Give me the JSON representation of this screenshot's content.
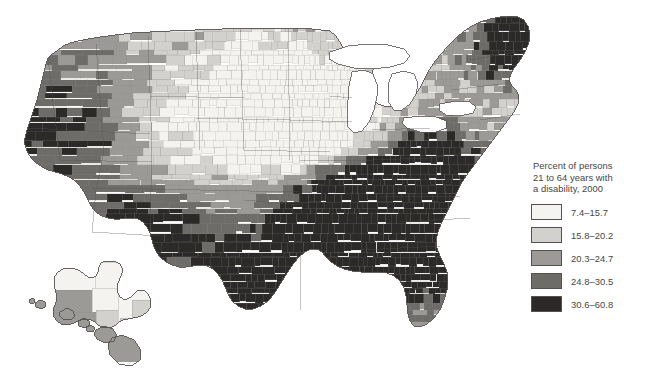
{
  "figure": {
    "kind": "choropleth-map",
    "region": "United States counties with Alaska and Hawaii insets",
    "background_color": "#ffffff",
    "water_color": "#ffffff",
    "border_color": "#55514e"
  },
  "legend": {
    "title": "Percent of persons\n21 to 64 years with\na disability, 2000",
    "title_lines": [
      "Percent of persons",
      "21 to 64 years with",
      "a disability, 2000"
    ],
    "classes": [
      {
        "label": "7.4–15.7",
        "color": "#f4f3f0",
        "min": 7.4,
        "max": 15.7
      },
      {
        "label": "15.8–20.2",
        "color": "#d2d1cd",
        "min": 15.8,
        "max": 20.2
      },
      {
        "label": "20.3–24.7",
        "color": "#9b9a96",
        "min": 20.3,
        "max": 24.7
      },
      {
        "label": "24.8–30.5",
        "color": "#6d6c69",
        "min": 24.8,
        "max": 30.5
      },
      {
        "label": "30.6–60.8",
        "color": "#2b2a28",
        "min": 30.6,
        "max": 60.8
      }
    ]
  },
  "chart_data": {
    "type": "heatmap",
    "title": "Percent of persons 21 to 64 years with a disability, 2000",
    "xlabel": "",
    "ylabel": "",
    "unit": "percent",
    "value_range": [
      7.4,
      60.8
    ],
    "classes": [
      "7.4–15.7",
      "15.8–20.2",
      "20.3–24.7",
      "24.8–30.5",
      "30.6–60.8"
    ],
    "class_colors": [
      "#f4f3f0",
      "#d2d1cd",
      "#9b9a96",
      "#6d6c69",
      "#2b2a28"
    ],
    "legend_position": "right",
    "grid": false,
    "regions": [
      {
        "name": "Maine",
        "class": 5,
        "note": "northern Maine darkest"
      },
      {
        "name": "Northern New England",
        "class": 4
      },
      {
        "name": "Southern New England",
        "class": 2
      },
      {
        "name": "New York metro",
        "class": 2
      },
      {
        "name": "Upstate New York",
        "class": 3
      },
      {
        "name": "Pennsylvania",
        "class": 3
      },
      {
        "name": "Appalachia / West Virginia",
        "class": 5
      },
      {
        "name": "Eastern Kentucky",
        "class": 5
      },
      {
        "name": "Tennessee",
        "class": 4
      },
      {
        "name": "Mississippi Delta",
        "class": 5
      },
      {
        "name": "Alabama",
        "class": 5
      },
      {
        "name": "Georgia",
        "class": 4
      },
      {
        "name": "Florida peninsula",
        "class": 3
      },
      {
        "name": "Carolinas",
        "class": 4
      },
      {
        "name": "Arkansas",
        "class": 4
      },
      {
        "name": "Louisiana",
        "class": 4
      },
      {
        "name": "Missouri Ozarks",
        "class": 4
      },
      {
        "name": "Illinois / Indiana / Ohio",
        "class": 2
      },
      {
        "name": "Michigan",
        "class": 2
      },
      {
        "name": "Wisconsin",
        "class": 1
      },
      {
        "name": "Minnesota",
        "class": 1
      },
      {
        "name": "Iowa",
        "class": 1
      },
      {
        "name": "Nebraska",
        "class": 1
      },
      {
        "name": "Kansas",
        "class": 2
      },
      {
        "name": "Dakotas",
        "class": 1,
        "note": "reservation counties class 5"
      },
      {
        "name": "Montana",
        "class": 2
      },
      {
        "name": "Wyoming",
        "class": 2
      },
      {
        "name": "Colorado",
        "class": 2
      },
      {
        "name": "Utah",
        "class": 2
      },
      {
        "name": "Idaho",
        "class": 3
      },
      {
        "name": "Oregon",
        "class": 3
      },
      {
        "name": "Washington",
        "class": 3
      },
      {
        "name": "Northern California",
        "class": 3
      },
      {
        "name": "Southern California",
        "class": 2
      },
      {
        "name": "Nevada",
        "class": 3
      },
      {
        "name": "Arizona",
        "class": 4
      },
      {
        "name": "New Mexico",
        "class": 4
      },
      {
        "name": "West Texas",
        "class": 3
      },
      {
        "name": "South Texas border",
        "class": 5
      },
      {
        "name": "Oklahoma",
        "class": 4
      },
      {
        "name": "Alaska interior",
        "class": 1
      },
      {
        "name": "Alaska southwest",
        "class": 3
      },
      {
        "name": "Hawaii",
        "class": 3
      }
    ]
  }
}
